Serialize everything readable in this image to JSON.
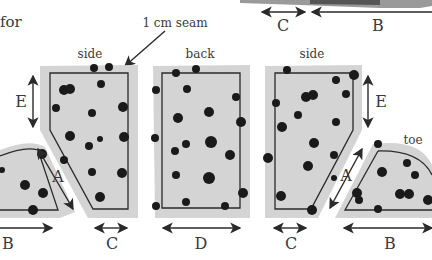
{
  "figure": {
    "caption_fragment": "for",
    "seam_label": "1 cm seam",
    "pieces": [
      {
        "id": "toe-left",
        "label": ""
      },
      {
        "id": "side-left",
        "label": "side"
      },
      {
        "id": "back",
        "label": "back"
      },
      {
        "id": "side-right",
        "label": "side"
      },
      {
        "id": "toe-right",
        "label": "toe"
      }
    ],
    "dimensions": {
      "A": "A",
      "B": "B",
      "C": "C",
      "D": "D",
      "E": "E"
    },
    "top_dimensions": [
      "C",
      "B"
    ],
    "colors": {
      "fabric": "#d4d4d4",
      "spots": "#1a1a1a",
      "outline": "#2a2a2a",
      "background": "#ffffff"
    }
  }
}
